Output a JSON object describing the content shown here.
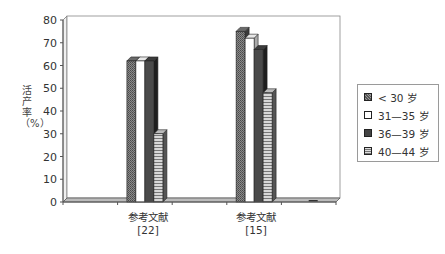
{
  "chart_data": {
    "type": "bar",
    "title": "",
    "xlabel": "",
    "ylabel": "活产率（%）",
    "ylim": [
      0,
      80
    ],
    "yticks": [
      0,
      10,
      20,
      30,
      40,
      50,
      60,
      70,
      80
    ],
    "grid": false,
    "legend_position": "right",
    "categories": [
      "",
      "参考文献\n[22]",
      "",
      "参考文献\n[15]",
      ""
    ],
    "category_labels": [
      {
        "line1": "",
        "line2": ""
      },
      {
        "line1": "参考文献",
        "line2": "[22]"
      },
      {
        "line1": "",
        "line2": ""
      },
      {
        "line1": "参考文献",
        "line2": "[15]"
      },
      {
        "line1": "",
        "line2": ""
      }
    ],
    "series": [
      {
        "name": "< 30 岁",
        "values": [
          0,
          62,
          0,
          75,
          0
        ]
      },
      {
        "name": "31—35 岁",
        "values": [
          0,
          62,
          0,
          72,
          0
        ]
      },
      {
        "name": "36—39 岁",
        "values": [
          0,
          62,
          0,
          67,
          0
        ]
      },
      {
        "name": "40—44 岁",
        "values": [
          0,
          30,
          0,
          48,
          0
        ]
      }
    ]
  },
  "legend": {
    "items": [
      {
        "label": "< 30 岁"
      },
      {
        "label": "31—35 岁"
      },
      {
        "label": "36—39 岁"
      },
      {
        "label": "40—44 岁"
      }
    ]
  }
}
